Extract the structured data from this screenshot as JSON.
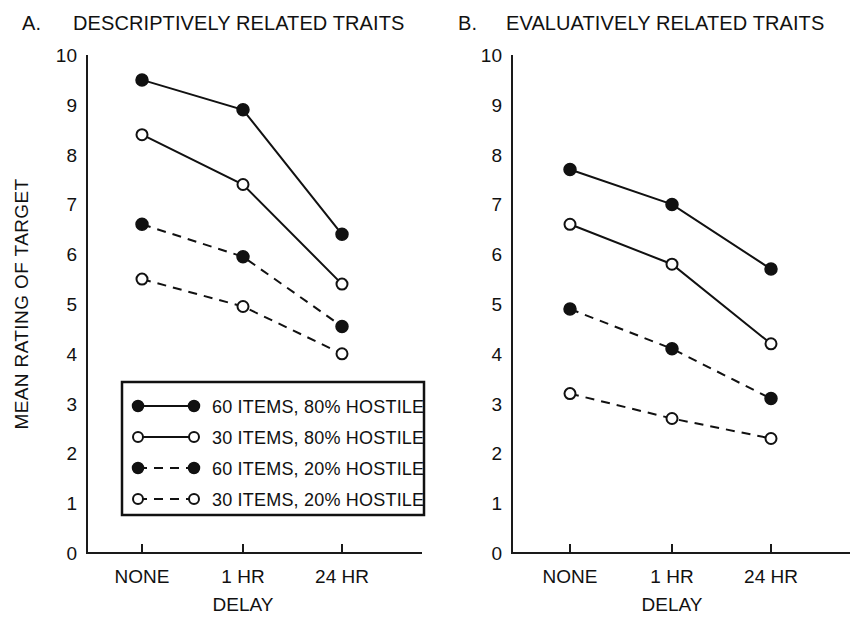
{
  "figure": {
    "background": "#ffffff",
    "ink_color": "#111111"
  },
  "panels": [
    {
      "letter": "A.",
      "title": "DESCRIPTIVELY RELATED TRAITS",
      "ylabel": "MEAN RATING OF TARGET",
      "xlabel": "DELAY",
      "show_ylabel": true,
      "show_legend": true
    },
    {
      "letter": "B.",
      "title": "EVALUATIVELY RELATED TRAITS",
      "ylabel": "",
      "xlabel": "DELAY",
      "show_ylabel": false,
      "show_legend": false
    }
  ],
  "legend": {
    "entries": [
      {
        "label": "60 ITEMS, 80% HOSTILE",
        "marker": "filled-circle",
        "line": "solid"
      },
      {
        "label": "30 ITEMS, 80% HOSTILE",
        "marker": "open-circle",
        "line": "solid"
      },
      {
        "label": "60 ITEMS, 20% HOSTILE",
        "marker": "filled-circle",
        "line": "dashed"
      },
      {
        "label": "30 ITEMS, 20% HOSTILE",
        "marker": "open-circle",
        "line": "dashed"
      }
    ]
  },
  "axis": {
    "yticks": [
      "10",
      "9",
      "8",
      "7",
      "6",
      "5",
      "4",
      "3",
      "2",
      "1",
      "0"
    ],
    "xticks": [
      "NONE",
      "1 HR",
      "24 HR"
    ]
  },
  "chart_data": [
    {
      "type": "line",
      "panel": "A",
      "title": "DESCRIPTIVELY RELATED TRAITS",
      "xlabel": "DELAY",
      "ylabel": "MEAN RATING OF TARGET",
      "categories": [
        "NONE",
        "1 HR",
        "24 HR"
      ],
      "ylim": [
        0,
        10
      ],
      "ytick_step": 1,
      "grid": false,
      "legend_position": "inside-lower-left",
      "series": [
        {
          "name": "60 ITEMS, 80% HOSTILE",
          "marker": "filled-circle",
          "line": "solid",
          "values": [
            9.5,
            8.9,
            6.4
          ]
        },
        {
          "name": "30 ITEMS, 80% HOSTILE",
          "marker": "open-circle",
          "line": "solid",
          "values": [
            8.4,
            7.4,
            5.4
          ]
        },
        {
          "name": "60 ITEMS, 20% HOSTILE",
          "marker": "filled-circle",
          "line": "dashed",
          "values": [
            6.6,
            5.95,
            4.55
          ]
        },
        {
          "name": "30 ITEMS, 20% HOSTILE",
          "marker": "open-circle",
          "line": "dashed",
          "values": [
            5.5,
            4.95,
            4.0
          ]
        }
      ]
    },
    {
      "type": "line",
      "panel": "B",
      "title": "EVALUATIVELY RELATED TRAITS",
      "xlabel": "DELAY",
      "ylabel": "",
      "categories": [
        "NONE",
        "1 HR",
        "24 HR"
      ],
      "ylim": [
        0,
        10
      ],
      "ytick_step": 1,
      "grid": false,
      "legend_position": "none",
      "series": [
        {
          "name": "60 ITEMS, 80% HOSTILE",
          "marker": "filled-circle",
          "line": "solid",
          "values": [
            7.7,
            7.0,
            5.7
          ]
        },
        {
          "name": "30 ITEMS, 80% HOSTILE",
          "marker": "open-circle",
          "line": "solid",
          "values": [
            6.6,
            5.8,
            4.2
          ]
        },
        {
          "name": "60 ITEMS, 20% HOSTILE",
          "marker": "filled-circle",
          "line": "dashed",
          "values": [
            4.9,
            4.1,
            3.1
          ]
        },
        {
          "name": "30 ITEMS, 20% HOSTILE",
          "marker": "open-circle",
          "line": "dashed",
          "values": [
            3.2,
            2.7,
            2.3
          ]
        }
      ]
    }
  ]
}
